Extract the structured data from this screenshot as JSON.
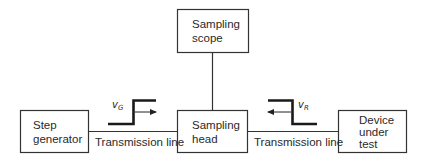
{
  "diagram": {
    "type": "block-diagram",
    "blocks": [
      {
        "id": "sampling-scope",
        "lines": [
          "Sampling",
          "scope"
        ]
      },
      {
        "id": "step-generator",
        "lines": [
          "Step",
          "generator"
        ]
      },
      {
        "id": "sampling-head",
        "lines": [
          "Sampling",
          "head"
        ]
      },
      {
        "id": "device-under-test",
        "lines": [
          "Device",
          "under",
          "test"
        ]
      }
    ],
    "connections": [
      {
        "from": "step-generator",
        "to": "sampling-head",
        "label": "Transmission line"
      },
      {
        "from": "sampling-head",
        "to": "device-under-test",
        "label": "Transmission line"
      },
      {
        "from": "sampling-scope",
        "to": "sampling-head",
        "label": ""
      }
    ],
    "signals": [
      {
        "id": "incident",
        "symbol": "v",
        "subscript": "G",
        "shape": "rising-step",
        "direction": "right"
      },
      {
        "id": "reflected",
        "symbol": "v",
        "subscript": "R",
        "shape": "falling-step",
        "direction": "left"
      }
    ]
  },
  "colors": {
    "stroke": "#333333",
    "thick_stroke": "#1a1a1a",
    "background": "#ffffff"
  }
}
